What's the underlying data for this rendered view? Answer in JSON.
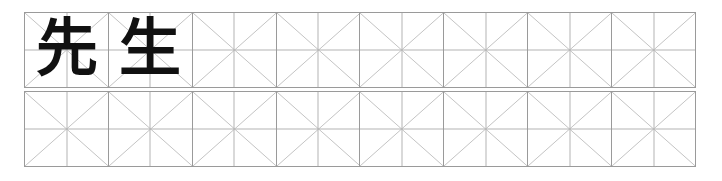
{
  "worksheet": {
    "title": "Character practice grid",
    "script_type": "kanji",
    "columns": 8,
    "rows": 2,
    "guide_style": "mizzi-grid",
    "cell_guides": [
      "diagonal-x",
      "center-cross"
    ],
    "colors": {
      "page_background": "#ffffff",
      "cell_border": "#9a9a9a",
      "guide_line": "#b4b4b4",
      "glyph": "#111111"
    },
    "rows_data": [
      {
        "row_label": "row-1",
        "cells": [
          {
            "char": "先",
            "filled": "true"
          },
          {
            "char": "生",
            "filled": "true"
          },
          {
            "char": "",
            "filled": "false"
          },
          {
            "char": "",
            "filled": "false"
          },
          {
            "char": "",
            "filled": "false"
          },
          {
            "char": "",
            "filled": "false"
          },
          {
            "char": "",
            "filled": "false"
          },
          {
            "char": "",
            "filled": "false"
          }
        ]
      },
      {
        "row_label": "row-2",
        "cells": [
          {
            "char": "",
            "filled": "false"
          },
          {
            "char": "",
            "filled": "false"
          },
          {
            "char": "",
            "filled": "false"
          },
          {
            "char": "",
            "filled": "false"
          },
          {
            "char": "",
            "filled": "false"
          },
          {
            "char": "",
            "filled": "false"
          },
          {
            "char": "",
            "filled": "false"
          },
          {
            "char": "",
            "filled": "false"
          }
        ]
      }
    ]
  }
}
